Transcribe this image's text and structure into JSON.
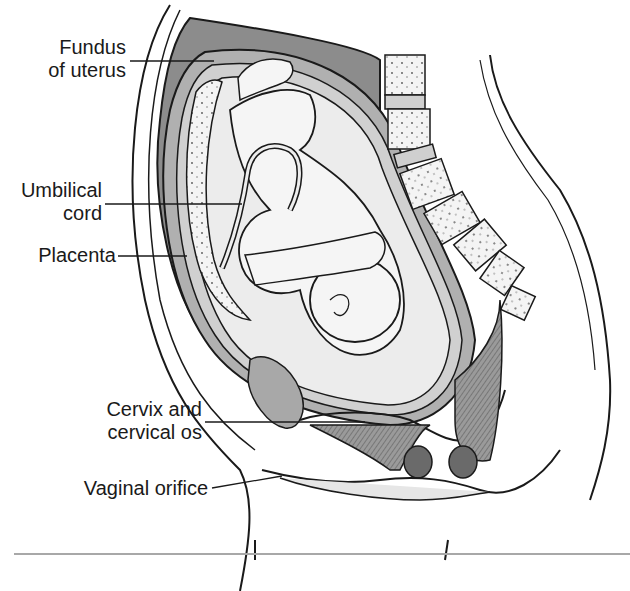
{
  "figure": {
    "colors": {
      "line": "#1a1a1a",
      "shade_dark": "#8c8c8c",
      "shade_mid": "#b0b0b0",
      "shade_light": "#d6d6d6",
      "background": "#ffffff",
      "rule": "#a8a8a8"
    }
  },
  "labels": [
    {
      "id": "fundus",
      "line1": "Fundus",
      "line2": "of uterus"
    },
    {
      "id": "umbilical",
      "line1": "Umbilical",
      "line2": "cord"
    },
    {
      "id": "placenta",
      "line1": "Placenta"
    },
    {
      "id": "cervix",
      "line1": "Cervix and",
      "line2": "cervical os"
    },
    {
      "id": "vaginal",
      "line1": "Vaginal orifice"
    }
  ]
}
